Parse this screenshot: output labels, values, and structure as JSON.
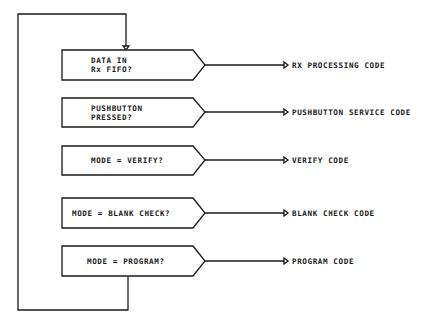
{
  "diagram": {
    "type": "flowchart",
    "colors": {
      "line": "#1a1a1a",
      "background": "#ffffff"
    },
    "decisions": [
      {
        "line1": "DATA IN",
        "line2": "Rx FIFO?",
        "target": "RX PROCESSING CODE"
      },
      {
        "line1": "PUSHBUTTON",
        "line2": "PRESSED?",
        "target": "PUSHBUTTON SERVICE CODE"
      },
      {
        "line1": "MODE = VERIFY?",
        "line2": "",
        "target": "VERIFY CODE"
      },
      {
        "line1": "MODE = BLANK CHECK?",
        "line2": "",
        "target": "BLANK CHECK CODE"
      },
      {
        "line1": "MODE = PROGRAM?",
        "line2": "",
        "target": "PROGRAM CODE"
      }
    ],
    "loop": "returns from last decision back to first decision"
  }
}
